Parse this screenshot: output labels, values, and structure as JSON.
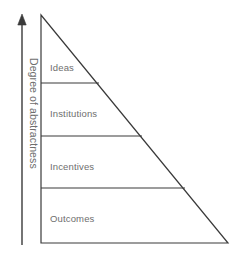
{
  "figure": {
    "background_color": "#ffffff",
    "line_color": "#3a3a3a",
    "text_color": "#6e6e6e",
    "width": 241,
    "height": 256
  },
  "axis": {
    "label": "Degree of abstractness",
    "direction": "upward",
    "arrow_icon": "up-arrow-icon",
    "x": 22,
    "top_y": 14,
    "bottom_y": 245
  },
  "pyramid": {
    "shape": "right-triangle",
    "apex": {
      "x": 41,
      "y": 15
    },
    "bottom_left": {
      "x": 41,
      "y": 243
    },
    "bottom_right": {
      "x": 228,
      "y": 243
    },
    "tiers": [
      {
        "label": "Ideas",
        "divider_y": 83,
        "divider_x_end": 99,
        "label_x": 50,
        "label_y": 62
      },
      {
        "label": "Institutions",
        "divider_y": 136,
        "divider_x_end": 142,
        "label_x": 50,
        "label_y": 108
      },
      {
        "label": "Incentives",
        "divider_y": 188,
        "divider_x_end": 185,
        "label_x": 50,
        "label_y": 161
      },
      {
        "label": "Outcomes",
        "divider_y": 243,
        "divider_x_end": 228,
        "label_x": 50,
        "label_y": 213
      }
    ]
  },
  "chart_data": {
    "type": "diagram",
    "title": "",
    "categories": [
      "Ideas",
      "Institutions",
      "Incentives",
      "Outcomes"
    ],
    "ylabel": "Degree of abstractness",
    "xlabel": "",
    "note": "Triangle partitioned into four horizontal tiers; abstractness increases upward from Outcomes to Ideas."
  }
}
